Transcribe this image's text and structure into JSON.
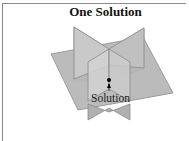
{
  "figure": {
    "title": "One Solution",
    "point_label": "Solution",
    "colors": {
      "plane_fill": "#b9b9b9",
      "plane_light": "#cfcfcf",
      "plane_edge": "#8c8c8c",
      "point": "#000000",
      "border": "#8a8a8a"
    }
  }
}
